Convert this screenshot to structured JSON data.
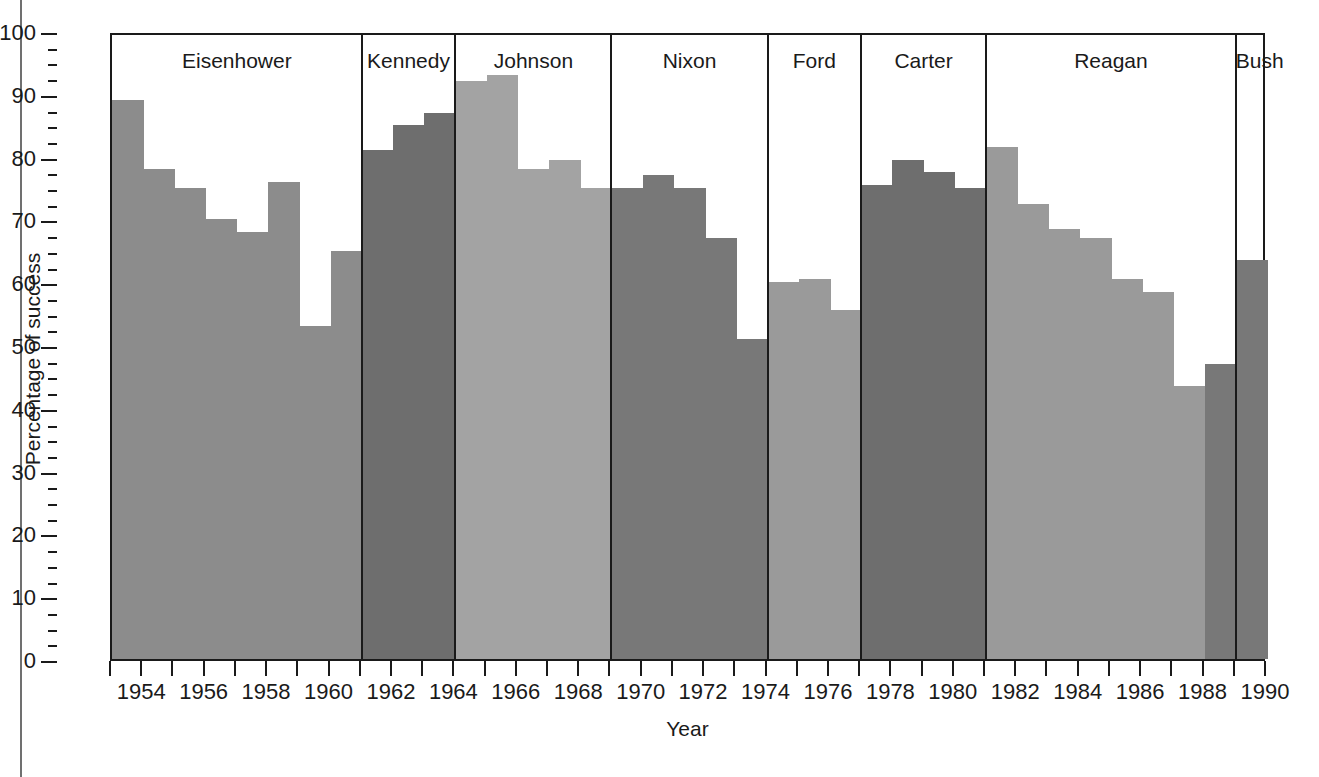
{
  "chart_data": {
    "type": "bar",
    "title": "",
    "xlabel": "Year",
    "ylabel": "Percentage of success",
    "xlim": [
      1953,
      1990
    ],
    "ylim": [
      0,
      100
    ],
    "grid": false,
    "legend": "none",
    "y_ticks_major": [
      0,
      10,
      20,
      30,
      40,
      50,
      60,
      70,
      80,
      90,
      100
    ],
    "y_tick_labels": [
      "0",
      "10",
      "20",
      "30",
      "40",
      "50",
      "60",
      "70",
      "80",
      "90",
      "100"
    ],
    "y_minor_tick_step": 2.5,
    "x_tick_years": [
      1953,
      1954,
      1955,
      1956,
      1957,
      1958,
      1959,
      1960,
      1961,
      1962,
      1963,
      1964,
      1965,
      1966,
      1967,
      1968,
      1969,
      1970,
      1971,
      1972,
      1973,
      1974,
      1975,
      1976,
      1977,
      1978,
      1979,
      1980,
      1981,
      1982,
      1983,
      1984,
      1985,
      1986,
      1987,
      1988,
      1989,
      1990
    ],
    "x_tick_labels": [
      {
        "year": 1954,
        "label": "1954"
      },
      {
        "year": 1956,
        "label": "1956"
      },
      {
        "year": 1958,
        "label": "1958"
      },
      {
        "year": 1960,
        "label": "1960"
      },
      {
        "year": 1962,
        "label": "1962"
      },
      {
        "year": 1964,
        "label": "1964"
      },
      {
        "year": 1966,
        "label": "1966"
      },
      {
        "year": 1968,
        "label": "1968"
      },
      {
        "year": 1970,
        "label": "1970"
      },
      {
        "year": 1972,
        "label": "1972"
      },
      {
        "year": 1974,
        "label": "1974"
      },
      {
        "year": 1976,
        "label": "1976"
      },
      {
        "year": 1978,
        "label": "1978"
      },
      {
        "year": 1980,
        "label": "1980"
      },
      {
        "year": 1982,
        "label": "1982"
      },
      {
        "year": 1984,
        "label": "1984"
      },
      {
        "year": 1986,
        "label": "1986"
      },
      {
        "year": 1988,
        "label": "1988"
      },
      {
        "year": 1990,
        "label": "1990"
      }
    ],
    "categories": [
      1953,
      1954,
      1955,
      1956,
      1957,
      1958,
      1959,
      1960,
      1961,
      1962,
      1963,
      1964,
      1965,
      1966,
      1967,
      1968,
      1969,
      1970,
      1971,
      1972,
      1973,
      1974,
      1975,
      1976,
      1977,
      1978,
      1979,
      1980,
      1981,
      1982,
      1983,
      1984,
      1985,
      1986,
      1987,
      1988,
      1989
    ],
    "values": [
      89,
      78,
      75,
      70,
      68,
      76,
      53,
      65,
      81,
      85,
      87,
      92,
      93,
      78,
      79.5,
      75,
      75,
      77,
      75,
      67,
      51,
      60,
      60.5,
      55.5,
      75.5,
      79.5,
      77.5,
      75,
      81.5,
      72.5,
      68.5,
      67,
      60.5,
      58.5,
      43.5,
      47,
      63.5
    ],
    "bars": [
      {
        "year": 1953,
        "value": 89,
        "administration": "Eisenhower",
        "color": "#8c8c8c"
      },
      {
        "year": 1954,
        "value": 78,
        "administration": "Eisenhower",
        "color": "#8c8c8c"
      },
      {
        "year": 1955,
        "value": 75,
        "administration": "Eisenhower",
        "color": "#8c8c8c"
      },
      {
        "year": 1956,
        "value": 70,
        "administration": "Eisenhower",
        "color": "#8c8c8c"
      },
      {
        "year": 1957,
        "value": 68,
        "administration": "Eisenhower",
        "color": "#8c8c8c"
      },
      {
        "year": 1958,
        "value": 76,
        "administration": "Eisenhower",
        "color": "#8c8c8c"
      },
      {
        "year": 1959,
        "value": 53,
        "administration": "Eisenhower",
        "color": "#8c8c8c"
      },
      {
        "year": 1960,
        "value": 65,
        "administration": "Eisenhower",
        "color": "#8c8c8c"
      },
      {
        "year": 1961,
        "value": 81,
        "administration": "Kennedy",
        "color": "#6e6e6e"
      },
      {
        "year": 1962,
        "value": 85,
        "administration": "Kennedy",
        "color": "#6e6e6e"
      },
      {
        "year": 1963,
        "value": 87,
        "administration": "Kennedy",
        "color": "#6e6e6e"
      },
      {
        "year": 1964,
        "value": 92,
        "administration": "Johnson",
        "color": "#a3a3a3"
      },
      {
        "year": 1965,
        "value": 93,
        "administration": "Johnson",
        "color": "#a3a3a3"
      },
      {
        "year": 1966,
        "value": 78,
        "administration": "Johnson",
        "color": "#a3a3a3"
      },
      {
        "year": 1967,
        "value": 79.5,
        "administration": "Johnson",
        "color": "#a3a3a3"
      },
      {
        "year": 1968,
        "value": 75,
        "administration": "Johnson",
        "color": "#a3a3a3"
      },
      {
        "year": 1969,
        "value": 75,
        "administration": "Nixon",
        "color": "#787878"
      },
      {
        "year": 1970,
        "value": 77,
        "administration": "Nixon",
        "color": "#787878"
      },
      {
        "year": 1971,
        "value": 75,
        "administration": "Nixon",
        "color": "#787878"
      },
      {
        "year": 1972,
        "value": 67,
        "administration": "Nixon",
        "color": "#787878"
      },
      {
        "year": 1973,
        "value": 51,
        "administration": "Nixon",
        "color": "#787878"
      },
      {
        "year": 1974,
        "value": 60,
        "administration": "Ford",
        "color": "#9a9a9a"
      },
      {
        "year": 1975,
        "value": 60.5,
        "administration": "Ford",
        "color": "#9a9a9a"
      },
      {
        "year": 1976,
        "value": 55.5,
        "administration": "Ford",
        "color": "#9a9a9a"
      },
      {
        "year": 1977,
        "value": 75.5,
        "administration": "Carter",
        "color": "#6e6e6e"
      },
      {
        "year": 1978,
        "value": 79.5,
        "administration": "Carter",
        "color": "#6e6e6e"
      },
      {
        "year": 1979,
        "value": 77.5,
        "administration": "Carter",
        "color": "#6e6e6e"
      },
      {
        "year": 1980,
        "value": 75,
        "administration": "Carter",
        "color": "#6e6e6e"
      },
      {
        "year": 1981,
        "value": 81.5,
        "administration": "Reagan",
        "color": "#9a9a9a"
      },
      {
        "year": 1982,
        "value": 72.5,
        "administration": "Reagan",
        "color": "#9a9a9a"
      },
      {
        "year": 1983,
        "value": 68.5,
        "administration": "Reagan",
        "color": "#9a9a9a"
      },
      {
        "year": 1984,
        "value": 67,
        "administration": "Reagan",
        "color": "#9a9a9a"
      },
      {
        "year": 1985,
        "value": 60.5,
        "administration": "Reagan",
        "color": "#9a9a9a"
      },
      {
        "year": 1986,
        "value": 58.5,
        "administration": "Reagan",
        "color": "#9a9a9a"
      },
      {
        "year": 1987,
        "value": 43.5,
        "administration": "Reagan",
        "color": "#9a9a9a"
      },
      {
        "year": 1988,
        "value": 47,
        "administration": "Bush",
        "color": "#787878"
      },
      {
        "year": 1989,
        "value": 63.5,
        "administration": "Bush",
        "color": "#787878"
      }
    ],
    "administrations": [
      {
        "label": "Eisenhower",
        "start_year": 1953,
        "end_year": 1961,
        "color": "#8c8c8c"
      },
      {
        "label": "Kennedy",
        "start_year": 1961,
        "end_year": 1964,
        "color": "#6e6e6e"
      },
      {
        "label": "Johnson",
        "start_year": 1964,
        "end_year": 1969,
        "color": "#a3a3a3"
      },
      {
        "label": "Nixon",
        "start_year": 1969,
        "end_year": 1974,
        "color": "#787878"
      },
      {
        "label": "Ford",
        "start_year": 1974,
        "end_year": 1977,
        "color": "#9a9a9a"
      },
      {
        "label": "Carter",
        "start_year": 1977,
        "end_year": 1981,
        "color": "#6e6e6e"
      },
      {
        "label": "Reagan",
        "start_year": 1981,
        "end_year": 1989,
        "color": "#9a9a9a"
      },
      {
        "label": "Bush",
        "start_year": 1989,
        "end_year": 1991,
        "color": "#787878"
      }
    ]
  },
  "colors": {
    "axis": "#1a1a1a",
    "background": "#ffffff",
    "page_rule": "#707070"
  }
}
